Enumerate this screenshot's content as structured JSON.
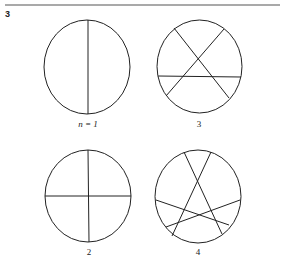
{
  "figure_number": "3",
  "panels": [
    {
      "label": "n = 1",
      "n": 1
    },
    {
      "label": "3",
      "n": 3
    },
    {
      "label": "2",
      "n": 2
    },
    {
      "label": "4",
      "n": 4
    }
  ],
  "colors": {
    "stroke": "#222222",
    "rule": "#555555"
  }
}
